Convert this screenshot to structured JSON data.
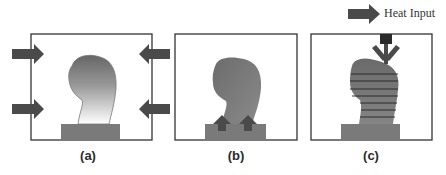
{
  "figure": {
    "legend": {
      "label": "Heat Input",
      "icon": "arrow-right-icon"
    },
    "panels": [
      {
        "id": "a",
        "label": "(a)",
        "description": "Part heated uniformly from all sides (furnace)"
      },
      {
        "id": "b",
        "label": "(b)",
        "description": "Heat input through the build plate from below"
      },
      {
        "id": "c",
        "label": "(c)",
        "description": "Localized heat input from above during layer-by-layer deposition"
      }
    ],
    "colors": {
      "arrow": "#4a4a4a",
      "frame": "#333333",
      "substrate": "#7a7a7a",
      "part_dark": "#6b6b6b",
      "part_light": "#ffffff",
      "layer_lines": "#222222",
      "nozzle": "#2b2b2b"
    }
  }
}
